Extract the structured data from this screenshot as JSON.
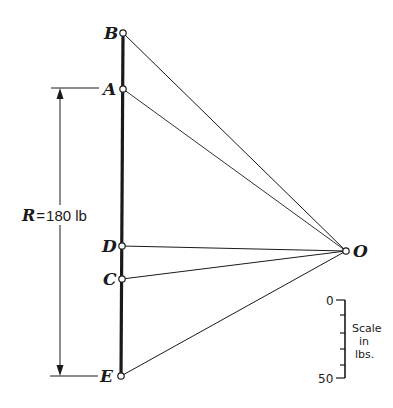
{
  "diagram": {
    "points": {
      "B": {
        "label": "B",
        "x": 123,
        "y": 33
      },
      "A": {
        "label": "A",
        "x": 123,
        "y": 89
      },
      "D": {
        "label": "D",
        "x": 122,
        "y": 246
      },
      "C": {
        "label": "C",
        "x": 122,
        "y": 279
      },
      "E": {
        "label": "E",
        "x": 121,
        "y": 376
      },
      "O": {
        "label": "O",
        "x": 346,
        "y": 251
      }
    },
    "reaction": {
      "symbol": "R",
      "equals": "=",
      "value": "180 lb"
    },
    "scale": {
      "top_value": "0",
      "bottom_value": "50",
      "label_line1": "Scale",
      "label_line2": "in",
      "label_line3": "lbs."
    },
    "colors": {
      "ink": "#1a1a1a",
      "background": "#ffffff"
    }
  }
}
